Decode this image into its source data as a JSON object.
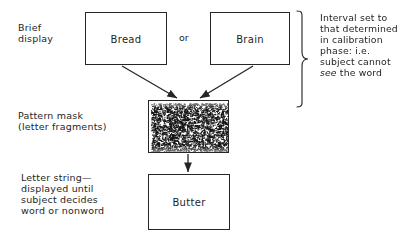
{
  "diagram": {
    "stage_labels": {
      "brief_display": "Brief\ndisplay",
      "pattern_mask": "Pattern mask\n(letter fragments)",
      "letter_string": "Letter string—\ndisplayed until\nsubject decides\nword or nonword"
    },
    "boxes": {
      "bread": "Bread",
      "brain": "Brain",
      "mask": "",
      "butter": "Butter"
    },
    "connector_text": "or",
    "note": {
      "lines": [
        "Interval set to",
        "that determined",
        "in calibration",
        "phase: i.e.",
        "subject cannot"
      ],
      "last_line_italic": "see",
      "last_line_rest": " the word"
    },
    "colors": {
      "background": "#ffffff",
      "ink": "#1f1f1f",
      "box_border": "#262626",
      "mask_speckle": "#141414"
    },
    "mask": {
      "description": "dense random letter-fragment speckle",
      "speckle_count": 2600
    }
  }
}
